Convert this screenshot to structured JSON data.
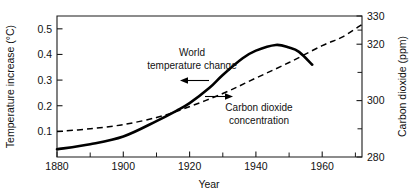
{
  "chart_data": {
    "type": "line",
    "title": "",
    "xlabel": "Year",
    "ylabel": "Temperature increase (°C)",
    "y2label": "Carbon dioxide (ppm)",
    "xlim": [
      1880,
      1972
    ],
    "ylim": [
      0.025,
      0.575
    ],
    "y2lim": [
      280,
      330
    ],
    "grid": false,
    "legend": "inline-annotations",
    "xticks": [
      1880,
      1900,
      1920,
      1940,
      1960
    ],
    "xticklabels": [
      "1880",
      "1900",
      "1920",
      "1940",
      "1960"
    ],
    "xminorticks": [
      1890,
      1910,
      1930,
      1950,
      1970
    ],
    "yticks": [
      0.1,
      0.2,
      0.3,
      0.4,
      0.5
    ],
    "yticklabels": [
      "0.1",
      "0.2",
      "0.3",
      "0.4",
      "0.5"
    ],
    "y2ticks": [
      280,
      300,
      320,
      330
    ],
    "y2ticklabels": [
      "280",
      "300",
      "320",
      "330"
    ],
    "y2minorticks": [
      290,
      310,
      325
    ],
    "series": [
      {
        "name": "World temperature change",
        "axis": "left",
        "style": "solid",
        "x": [
          1880,
          1890,
          1900,
          1910,
          1916,
          1920,
          1926,
          1930,
          1936,
          1940,
          1946,
          1950,
          1953,
          1957
        ],
        "values": [
          0.055,
          0.075,
          0.105,
          0.165,
          0.205,
          0.235,
          0.295,
          0.345,
          0.41,
          0.44,
          0.462,
          0.452,
          0.435,
          0.385
        ]
      },
      {
        "name": "Carbon dioxide concentration",
        "axis": "right",
        "style": "dashed",
        "x": [
          1880,
          1890,
          1900,
          1910,
          1918,
          1930,
          1940,
          1950,
          1960,
          1966,
          1972
        ],
        "values": [
          289.0,
          290.0,
          291.5,
          294.0,
          297.0,
          302.5,
          308.0,
          313.5,
          319.5,
          322.5,
          327.0
        ]
      }
    ],
    "annotations": [
      {
        "name": "world-temperature-change",
        "lines": [
          "World",
          "temperature change"
        ],
        "points_to": "solid-curve",
        "arrow_direction": "left"
      },
      {
        "name": "carbon-dioxide-concentration",
        "lines": [
          "Carbon dioxide",
          "concentration"
        ],
        "points_to": "dashed-curve",
        "arrow_direction": "right"
      }
    ]
  }
}
